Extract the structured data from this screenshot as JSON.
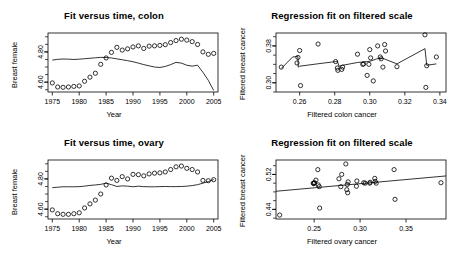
{
  "figure": {
    "width": 456,
    "height": 254,
    "background": "#ffffff",
    "foreground": "#000000",
    "layout": "2x2 panel grid"
  },
  "chart_data": [
    {
      "id": "fit-versus-time-colon",
      "type": "scatter",
      "title": "Fit versus time, colon",
      "xlabel": "Year",
      "ylabel": "Breast female",
      "xlim": [
        1974.2,
        2005.8
      ],
      "ylim": [
        4.535,
        4.925
      ],
      "xticks": [
        1975,
        1980,
        1985,
        1990,
        1995,
        2000,
        2005
      ],
      "xticklabels": [
        "1975",
        "1980",
        "1985",
        "1990",
        "1995",
        "2000",
        "2005"
      ],
      "yticks": [
        4.6,
        4.8
      ],
      "yticklabels": [
        "4.60",
        "4.80"
      ],
      "grid": false,
      "legend": null,
      "series": [
        {
          "name": "observed",
          "kind": "points",
          "marker": "open-circle",
          "x": [
            1975,
            1976,
            1977,
            1978,
            1979,
            1980,
            1981,
            1982,
            1983,
            1984,
            1985,
            1986,
            1987,
            1988,
            1989,
            1990,
            1991,
            1992,
            1993,
            1994,
            1995,
            1996,
            1997,
            1998,
            1999,
            2000,
            2001,
            2002,
            2003,
            2004,
            2005
          ],
          "values": [
            4.595,
            4.568,
            4.566,
            4.568,
            4.572,
            4.575,
            4.606,
            4.633,
            4.659,
            4.718,
            4.76,
            4.797,
            4.83,
            4.812,
            4.82,
            4.833,
            4.84,
            4.823,
            4.838,
            4.84,
            4.843,
            4.848,
            4.862,
            4.875,
            4.884,
            4.878,
            4.868,
            4.849,
            4.8,
            4.784,
            4.79
          ]
        },
        {
          "name": "fitted",
          "kind": "line",
          "x": [
            1975,
            1976,
            1977,
            1978,
            1979,
            1980,
            1981,
            1982,
            1983,
            1984,
            1985,
            1986,
            1987,
            1988,
            1989,
            1990,
            1991,
            1992,
            1993,
            1994,
            1995,
            1996,
            1997,
            1998,
            1999,
            2000,
            2001,
            2002,
            2003,
            2004,
            2005
          ],
          "values": [
            4.746,
            4.751,
            4.753,
            4.752,
            4.75,
            4.752,
            4.755,
            4.758,
            4.761,
            4.764,
            4.763,
            4.76,
            4.754,
            4.748,
            4.742,
            4.735,
            4.726,
            4.716,
            4.708,
            4.7,
            4.697,
            4.704,
            4.716,
            4.731,
            4.726,
            4.712,
            4.706,
            4.712,
            4.665,
            4.612,
            4.545
          ]
        }
      ]
    },
    {
      "id": "regression-fit-filtered-colon",
      "type": "scatter",
      "title": "Regression fit on filtered scale",
      "xlabel": "Filtered colon cancer",
      "ylabel": "Filtered breast cancer",
      "xlim": [
        0.2465,
        0.3435
      ],
      "ylim": [
        0.28,
        0.408
      ],
      "xticks": [
        0.26,
        0.28,
        0.3,
        0.32,
        0.34
      ],
      "xticklabels": [
        "0.26",
        "0.28",
        "0.30",
        "0.32",
        "0.34"
      ],
      "yticks": [
        0.3,
        0.38
      ],
      "yticklabels": [
        "0.30",
        "0.38"
      ],
      "grid": false,
      "legend": null,
      "series": [
        {
          "name": "observed",
          "kind": "points",
          "marker": "open-circle",
          "x": [
            0.2495,
            0.2585,
            0.259,
            0.26,
            0.2605,
            0.2705,
            0.2805,
            0.2815,
            0.2818,
            0.284,
            0.2845,
            0.293,
            0.296,
            0.2965,
            0.2985,
            0.2995,
            0.3,
            0.3005,
            0.302,
            0.3045,
            0.306,
            0.3065,
            0.3075,
            0.3085,
            0.309,
            0.3155,
            0.3315,
            0.332,
            0.3325,
            0.338
          ],
          "values": [
            0.334,
            0.343,
            0.355,
            0.37,
            0.294,
            0.384,
            0.346,
            0.332,
            0.327,
            0.329,
            0.334,
            0.362,
            0.34,
            0.341,
            0.316,
            0.34,
            0.372,
            0.354,
            0.304,
            0.38,
            0.356,
            0.352,
            0.334,
            0.383,
            0.369,
            0.335,
            0.404,
            0.29,
            0.337,
            0.356
          ]
        },
        {
          "name": "fit",
          "kind": "line",
          "x": [
            0.2495,
            0.256,
            0.259,
            0.2592,
            0.26,
            0.27,
            0.2805,
            0.2815,
            0.2825,
            0.2845,
            0.293,
            0.2985,
            0.3005,
            0.304,
            0.3065,
            0.3075,
            0.3155,
            0.331,
            0.3315,
            0.3325,
            0.338
          ],
          "values": [
            0.331,
            0.356,
            0.357,
            0.334,
            0.336,
            0.341,
            0.346,
            0.347,
            0.336,
            0.338,
            0.344,
            0.346,
            0.347,
            0.352,
            0.353,
            0.353,
            0.341,
            0.373,
            0.374,
            0.338,
            0.341
          ]
        }
      ]
    },
    {
      "id": "fit-versus-time-ovary",
      "type": "scatter",
      "title": "Fit versus time, ovary",
      "xlabel": "Year",
      "ylabel": "Breast female",
      "xlim": [
        1974.2,
        2005.8
      ],
      "ylim": [
        4.535,
        4.925
      ],
      "xticks": [
        1975,
        1980,
        1985,
        1990,
        1995,
        2000,
        2005
      ],
      "xticklabels": [
        "1975",
        "1980",
        "1985",
        "1990",
        "1995",
        "2000",
        "2005"
      ],
      "yticks": [
        4.6,
        4.8
      ],
      "yticklabels": [
        "4.60",
        "4.80"
      ],
      "grid": false,
      "legend": null,
      "series": [
        {
          "name": "observed",
          "kind": "points",
          "marker": "open-circle",
          "x": [
            1975,
            1976,
            1977,
            1978,
            1979,
            1980,
            1981,
            1982,
            1983,
            1984,
            1985,
            1986,
            1987,
            1988,
            1989,
            1990,
            1991,
            1992,
            1993,
            1994,
            1995,
            1996,
            1997,
            1998,
            1999,
            2000,
            2001,
            2002,
            2003,
            2004,
            2005
          ],
          "values": [
            4.595,
            4.57,
            4.566,
            4.566,
            4.57,
            4.576,
            4.608,
            4.635,
            4.66,
            4.7,
            4.76,
            4.805,
            4.79,
            4.815,
            4.8,
            4.83,
            4.828,
            4.82,
            4.833,
            4.838,
            4.84,
            4.846,
            4.862,
            4.88,
            4.885,
            4.87,
            4.862,
            4.846,
            4.79,
            4.788,
            4.795
          ]
        },
        {
          "name": "fitted",
          "kind": "line",
          "x": [
            1975,
            1976,
            1977,
            1978,
            1979,
            1980,
            1981,
            1982,
            1983,
            1984,
            1985,
            1986,
            1987,
            1988,
            1989,
            1990,
            1991,
            1992,
            1993,
            1994,
            1995,
            1996,
            1997,
            1998,
            1999,
            2000,
            2001,
            2002,
            2003,
            2004,
            2005
          ],
          "values": [
            4.742,
            4.745,
            4.748,
            4.748,
            4.748,
            4.749,
            4.752,
            4.757,
            4.76,
            4.764,
            4.772,
            4.762,
            4.75,
            4.754,
            4.752,
            4.748,
            4.752,
            4.749,
            4.748,
            4.748,
            4.749,
            4.75,
            4.749,
            4.749,
            4.75,
            4.752,
            4.756,
            4.762,
            4.772,
            4.782,
            4.796
          ]
        }
      ]
    },
    {
      "id": "regression-fit-filtered-ovary",
      "type": "scatter",
      "title": "Regression fit on filtered scale",
      "xlabel": "Filtered ovary cancer",
      "ylabel": "Filtered breast cancer",
      "xlim": [
        0.2085,
        0.3935
      ],
      "ylim": [
        0.418,
        0.553
      ],
      "xticks": [
        0.25,
        0.3,
        0.35
      ],
      "xticklabels": [
        "0.25",
        "0.30",
        "0.35"
      ],
      "yticks": [
        0.44,
        0.52
      ],
      "yticklabels": [
        "0.44",
        "0.52"
      ],
      "grid": false,
      "legend": null,
      "series": [
        {
          "name": "observed",
          "kind": "points",
          "marker": "open-circle",
          "x": [
            0.2125,
            0.249,
            0.2495,
            0.25,
            0.2505,
            0.252,
            0.254,
            0.2545,
            0.2555,
            0.256,
            0.277,
            0.279,
            0.28,
            0.2845,
            0.2855,
            0.286,
            0.2865,
            0.287,
            0.296,
            0.2965,
            0.304,
            0.3055,
            0.3105,
            0.311,
            0.316,
            0.3165,
            0.3175,
            0.337,
            0.338,
            0.388
          ],
          "values": [
            0.427,
            0.5,
            0.499,
            0.5,
            0.501,
            0.507,
            0.531,
            0.496,
            0.492,
            0.443,
            0.51,
            0.492,
            0.52,
            0.544,
            0.485,
            0.497,
            0.478,
            0.503,
            0.493,
            0.505,
            0.501,
            0.5,
            0.5,
            0.502,
            0.511,
            0.504,
            0.5,
            0.531,
            0.463,
            0.501
          ]
        },
        {
          "name": "fit",
          "kind": "line",
          "x": [
            0.2085,
            0.3935
          ],
          "values": [
            0.4815,
            0.5165
          ]
        }
      ]
    }
  ]
}
